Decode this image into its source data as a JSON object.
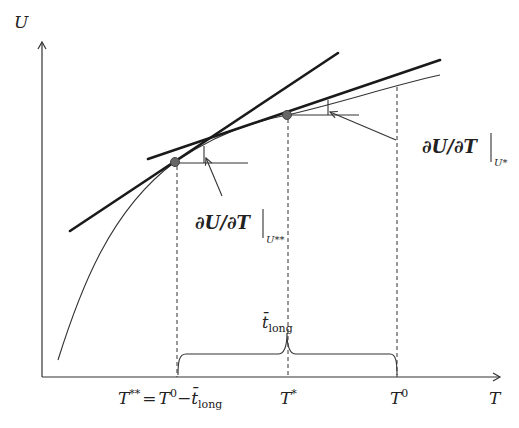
{
  "axes": {
    "y_label": "U",
    "x_label": "T"
  },
  "ticks": {
    "t_double_star": {
      "main": "T",
      "sup": "**",
      "eq": "=",
      "t0": "T",
      "t0_sup": "0",
      "minus": "−",
      "tbar": "t̄",
      "tbar_sub": "long"
    },
    "t_star": {
      "main": "T",
      "sup": "*"
    },
    "t_zero": {
      "main": "T",
      "sup": "0"
    }
  },
  "brace_label": {
    "main": "t̄",
    "sub": "long"
  },
  "annotations": {
    "slope_at_u_double_star": {
      "text": "∂U/∂T",
      "bar": "|",
      "sub": "U**"
    },
    "slope_at_u_star": {
      "text": "∂U/∂T",
      "bar": "|",
      "sub": "U*"
    }
  },
  "points": [
    {
      "name": "T**",
      "x": 175,
      "y": 162
    },
    {
      "name": "T*",
      "x": 287,
      "y": 115
    }
  ],
  "colors": {
    "line": "#1a1a1a",
    "curve": "#333333",
    "point": "#666666"
  }
}
